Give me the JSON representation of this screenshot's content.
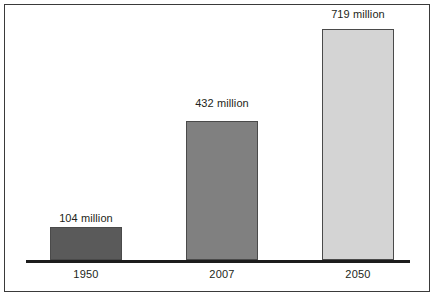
{
  "chart_data": {
    "type": "bar",
    "title": "",
    "subtitle": "",
    "xlabel": "",
    "ylabel": "",
    "grid": false,
    "legend": false,
    "ylim": [
      0,
      760
    ],
    "unit": "million",
    "categories": [
      "1950",
      "2007",
      "2050"
    ],
    "values": [
      104,
      432,
      719
    ],
    "value_labels": [
      "104 million",
      "432 million",
      "719 million"
    ],
    "bars": [
      {
        "category": "1950",
        "value": 104,
        "label": "104 million",
        "color": "#5a5a5a"
      },
      {
        "category": "2007",
        "value": 432,
        "label": "432 million",
        "color": "#808080"
      },
      {
        "category": "2050",
        "value": 719,
        "label": "719 million",
        "color": "#d4d4d4"
      }
    ],
    "colors": {
      "bar_1": "#5a5a5a",
      "bar_2": "#808080",
      "bar_3": "#d4d4d4",
      "bar_border": "#4a4a4a",
      "axis": "#1c1c1c",
      "frame": "#3a3a3a",
      "text": "#231f20",
      "background": "#ffffff"
    }
  }
}
